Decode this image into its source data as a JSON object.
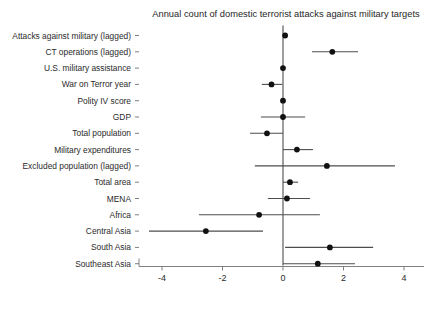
{
  "chart_data": {
    "type": "scatter",
    "subtype": "coefficient-plot-with-confidence-intervals",
    "title": "Annual count of domestic terrorist attacks against military targets",
    "xlabel": "",
    "ylabel": "",
    "xlim": [
      -4.6,
      4.3
    ],
    "ylim_categories_top_to_bottom": true,
    "grid": false,
    "legend": "none",
    "reference_line": {
      "x": 0,
      "style": "solid",
      "color": "#4d4d4d"
    },
    "xticks": [
      -4,
      -2,
      0,
      2,
      4
    ],
    "xtick_labels": [
      "-4",
      "-2",
      "0",
      "2",
      "4"
    ],
    "categories": [
      "Attacks against military (lagged)",
      "CT operations (lagged)",
      "U.S. military assistance",
      "War on Terror year",
      "Polity IV score",
      "GDP",
      "Total population",
      "Military expenditures",
      "Excluded population (lagged)",
      "Total area",
      "MENA",
      "Africa",
      "Central Asia",
      "South Asia",
      "Southeast Asia"
    ],
    "points": [
      {
        "label": "Attacks against military (lagged)",
        "estimate": 0.07,
        "ci_low": 0.02,
        "ci_high": 0.12
      },
      {
        "label": "CT operations (lagged)",
        "estimate": 1.63,
        "ci_low": 0.96,
        "ci_high": 2.48
      },
      {
        "label": "U.S. military assistance",
        "estimate": 0.0,
        "ci_low": -0.05,
        "ci_high": 0.05
      },
      {
        "label": "War on Terror year",
        "estimate": -0.38,
        "ci_low": -0.7,
        "ci_high": -0.02
      },
      {
        "label": "Polity IV score",
        "estimate": 0.0,
        "ci_low": -0.04,
        "ci_high": 0.04
      },
      {
        "label": "GDP",
        "estimate": 0.0,
        "ci_low": -0.73,
        "ci_high": 0.73
      },
      {
        "label": "Total population",
        "estimate": -0.53,
        "ci_low": -1.09,
        "ci_high": 0.0
      },
      {
        "label": "Military expenditures",
        "estimate": 0.46,
        "ci_low": 0.0,
        "ci_high": 0.99
      },
      {
        "label": "Excluded population (lagged)",
        "estimate": 1.45,
        "ci_low": -0.93,
        "ci_high": 3.7
      },
      {
        "label": "Total area",
        "estimate": 0.23,
        "ci_low": 0.0,
        "ci_high": 0.5
      },
      {
        "label": "MENA",
        "estimate": 0.13,
        "ci_low": -0.5,
        "ci_high": 0.89
      },
      {
        "label": "Africa",
        "estimate": -0.79,
        "ci_low": -2.78,
        "ci_high": 1.22
      },
      {
        "label": "Central Asia",
        "estimate": -2.55,
        "ci_low": -4.43,
        "ci_high": -0.66
      },
      {
        "label": "South Asia",
        "estimate": 1.55,
        "ci_low": 0.07,
        "ci_high": 2.98
      },
      {
        "label": "Southeast Asia",
        "estimate": 1.15,
        "ci_low": 0.0,
        "ci_high": 2.38
      }
    ],
    "colors": {
      "point": "#111111",
      "interval": "#4d4d4d",
      "axis": "#808080",
      "text": "#2b2b2b"
    }
  }
}
